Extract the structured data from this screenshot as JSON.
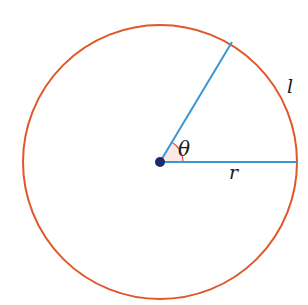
{
  "diagram": {
    "labels": {
      "angle": "θ",
      "radius": "r",
      "arc": "l"
    },
    "colors": {
      "circle": "#e0572a",
      "radius_lines": "#3a97d4",
      "center_point": "#1f2a6e",
      "angle_fill": "#fbe9e7",
      "angle_arc": "#d9534f"
    },
    "geometry": {
      "center": [
        160,
        162
      ],
      "radius": 137,
      "angle_deg": 59
    }
  }
}
